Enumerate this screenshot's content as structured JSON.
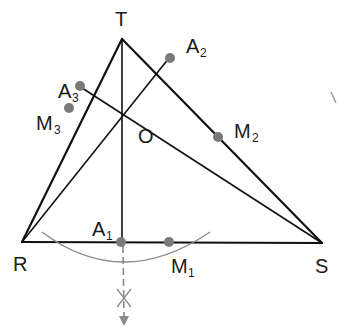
{
  "figure": {
    "colors": {
      "line": "#111111",
      "point": "#7a7a7a",
      "construction": "#8a8a8a",
      "background": "#ffffff"
    },
    "vertices": {
      "T": {
        "label": "T",
        "x": 122,
        "y": 39
      },
      "R": {
        "label": "R",
        "x": 22,
        "y": 242
      },
      "S": {
        "label": "S",
        "x": 322,
        "y": 243
      }
    },
    "center": {
      "label": "O",
      "x": 123,
      "y": 112
    },
    "points": [
      {
        "id": "A1",
        "base": "A",
        "sub": "1",
        "x": 122,
        "y": 242
      },
      {
        "id": "M1",
        "base": "M",
        "sub": "1",
        "x": 169,
        "y": 242
      },
      {
        "id": "A2",
        "base": "A",
        "sub": "2",
        "x": 169,
        "y": 58
      },
      {
        "id": "M2",
        "base": "M",
        "sub": "2",
        "x": 218,
        "y": 137
      },
      {
        "id": "A3",
        "base": "A",
        "sub": "3",
        "x": 79,
        "y": 86
      },
      {
        "id": "M3",
        "base": "M",
        "sub": "3",
        "x": 69,
        "y": 108
      }
    ],
    "labels": {
      "T": "T",
      "R": "R",
      "S": "S",
      "O": "O",
      "A1": "A",
      "A1_sub": "1",
      "M1": "M",
      "M1_sub": "1",
      "A2": "A",
      "A2_sub": "2",
      "M2": "M",
      "M2_sub": "2",
      "A3": "A",
      "A3_sub": "3",
      "M3": "M",
      "M3_sub": "3"
    }
  }
}
